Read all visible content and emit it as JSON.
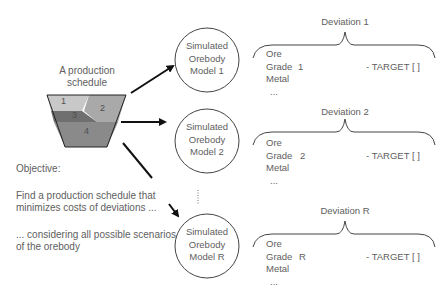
{
  "schedule": {
    "title_line1": "A production",
    "title_line2": "schedule",
    "segments": [
      {
        "label": "1",
        "color": "#c8c8c8"
      },
      {
        "label": "2",
        "color": "#a9a9a9"
      },
      {
        "label": "3",
        "color": "#6f6f6f"
      },
      {
        "label": "4",
        "color": "#8a8a8a"
      }
    ]
  },
  "objective": {
    "heading": "Objective:",
    "line1": "Find a production schedule that",
    "line2": "minimizes costs of deviations ...",
    "line3": "... considering all possible scenarios",
    "line4": "of the orebody"
  },
  "models": [
    {
      "line1": "Simulated",
      "line2": "Orebody",
      "line3": "Model 1"
    },
    {
      "line1": "Simulated",
      "line2": "Orebody",
      "line3": "Model 2"
    },
    {
      "line1": "Simulated",
      "line2": "Orebody",
      "line3": "Model R"
    }
  ],
  "deviations": [
    {
      "title": "Deviation 1",
      "items": [
        "Ore",
        "Grade",
        "Metal",
        "..."
      ],
      "index": "1",
      "target": "- TARGET [ ]"
    },
    {
      "title": "Deviation 2",
      "items": [
        "Ore",
        "Grade",
        "Metal",
        "..."
      ],
      "index": "2",
      "target": "- TARGET [ ]"
    },
    {
      "title": "Deviation R",
      "items": [
        "Ore",
        "Grade",
        "Metal",
        "..."
      ],
      "index": "R",
      "target": "- TARGET [ ]"
    }
  ],
  "ellipsis_vertical": "⋮"
}
